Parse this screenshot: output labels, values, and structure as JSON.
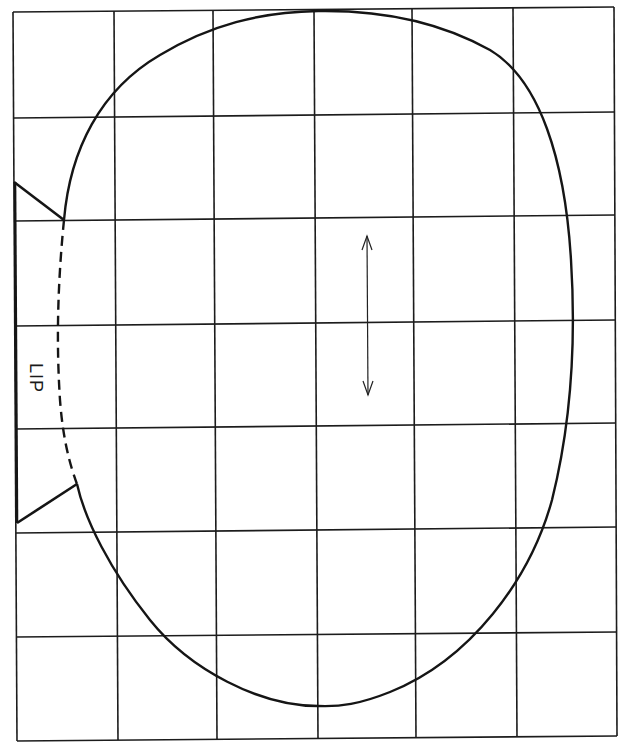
{
  "diagram": {
    "type": "sewing-pattern-grid",
    "grid": {
      "columns": 6,
      "rows": 7
    },
    "labels": {
      "lip": "LIP"
    },
    "annotations": {
      "grainline_arrow": "double-headed vertical arrow",
      "lip_edge": "dashed curve"
    },
    "colors": {
      "line": "#151515",
      "background": "#ffffff"
    }
  }
}
